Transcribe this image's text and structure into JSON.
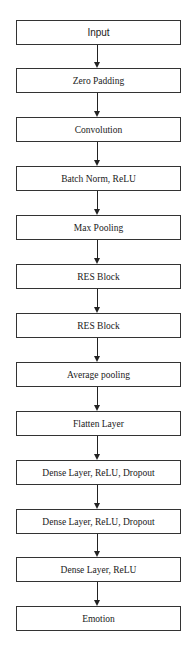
{
  "diagram": {
    "type": "flowchart",
    "direction": "top-to-bottom",
    "nodes": [
      {
        "id": "input",
        "label": "Input"
      },
      {
        "id": "zero-padding",
        "label": "Zero Padding"
      },
      {
        "id": "convolution",
        "label": "Convolution"
      },
      {
        "id": "batch-norm-relu",
        "label": "Batch Norm, ReLU"
      },
      {
        "id": "max-pooling",
        "label": "Max Pooling"
      },
      {
        "id": "res-block-1",
        "label": "RES Block"
      },
      {
        "id": "res-block-2",
        "label": "RES Block"
      },
      {
        "id": "average-pooling",
        "label": "Average pooling"
      },
      {
        "id": "flatten-layer",
        "label": "Flatten Layer"
      },
      {
        "id": "dense-relu-dropout-1",
        "label": "Dense Layer, ReLU, Dropout"
      },
      {
        "id": "dense-relu-dropout-2",
        "label": "Dense Layer, ReLU, Dropout"
      },
      {
        "id": "dense-relu",
        "label": "Dense Layer, ReLU"
      },
      {
        "id": "emotion",
        "label": "Emotion"
      }
    ],
    "edges": [
      {
        "from": "input",
        "to": "zero-padding"
      },
      {
        "from": "zero-padding",
        "to": "convolution"
      },
      {
        "from": "convolution",
        "to": "batch-norm-relu"
      },
      {
        "from": "batch-norm-relu",
        "to": "max-pooling"
      },
      {
        "from": "max-pooling",
        "to": "res-block-1"
      },
      {
        "from": "res-block-1",
        "to": "res-block-2"
      },
      {
        "from": "res-block-2",
        "to": "average-pooling"
      },
      {
        "from": "average-pooling",
        "to": "flatten-layer"
      },
      {
        "from": "flatten-layer",
        "to": "dense-relu-dropout-1"
      },
      {
        "from": "dense-relu-dropout-1",
        "to": "dense-relu-dropout-2"
      },
      {
        "from": "dense-relu-dropout-2",
        "to": "dense-relu"
      },
      {
        "from": "dense-relu",
        "to": "emotion"
      }
    ],
    "colors": {
      "border": "#333333",
      "arrow": "#222222",
      "text": "#1a1a1a",
      "background": "#ffffff"
    }
  }
}
